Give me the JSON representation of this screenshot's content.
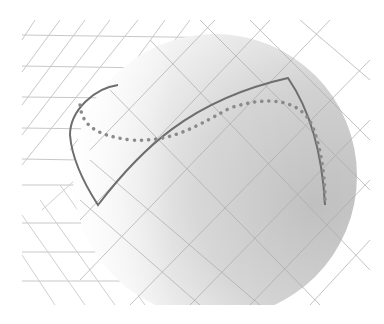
{
  "figure": {
    "width": 384,
    "height": 324,
    "background": "#ffffff",
    "sphere": {
      "cx": 215,
      "cy": 176,
      "r": 142,
      "light_color": "#ffffff",
      "dark_color": "#bdbdbd"
    },
    "grid_color": "#c4c4c4",
    "solid_curve_color": "#6e6e6e",
    "dotted_curve_color": "#8a8a8a"
  }
}
